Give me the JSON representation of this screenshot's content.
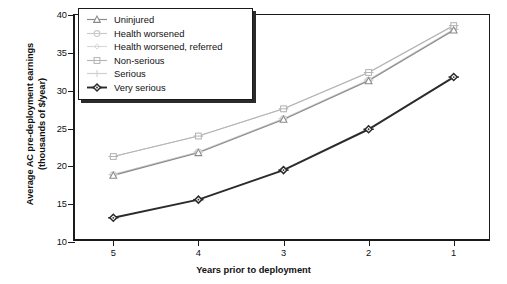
{
  "chart_data": {
    "type": "line",
    "title": "",
    "xlabel": "Years prior to deployment",
    "ylabel": "Average AC pre-deployment earnings (thousands of $/year)",
    "ylabel_line1": "Average AC pre-deployment earnings",
    "ylabel_line2": "(thousands of $/year)",
    "categories": [
      "5",
      "4",
      "3",
      "2",
      "1"
    ],
    "x": [
      5,
      4,
      3,
      2,
      1
    ],
    "xlim": [
      5.45,
      0.55
    ],
    "ylim": [
      10,
      40
    ],
    "yticks": [
      10,
      15,
      20,
      25,
      30,
      35,
      40
    ],
    "xticks": [
      5,
      4,
      3,
      2,
      1
    ],
    "grid": false,
    "legend_position": "top-left-inset",
    "series": [
      {
        "name": "Uninjured",
        "marker": "triangle",
        "color": "#8a8a8a",
        "values": [
          18.8,
          21.8,
          26.2,
          31.3,
          38.0
        ]
      },
      {
        "name": "Health worsened",
        "marker": "circle",
        "color": "#c9c9c9",
        "values": [
          18.9,
          21.9,
          26.3,
          31.4,
          38.1
        ]
      },
      {
        "name": "Health worsened, referred",
        "marker": "diamond-light",
        "color": "#d8d8d8",
        "values": [
          18.9,
          21.9,
          26.3,
          31.4,
          38.1
        ]
      },
      {
        "name": "Non-serious",
        "marker": "square",
        "color": "#b5b5b5",
        "values": [
          21.3,
          24.0,
          27.6,
          32.4,
          38.6
        ]
      },
      {
        "name": "Serious",
        "marker": "plus",
        "color": "#d0d0d0",
        "values": [
          21.3,
          24.0,
          27.6,
          32.4,
          38.6
        ]
      },
      {
        "name": "Very serious",
        "marker": "diamond-dark",
        "color": "#2b2b2b",
        "values": [
          13.2,
          15.6,
          19.5,
          24.9,
          31.8
        ]
      }
    ]
  },
  "legend": {
    "items": [
      {
        "label": "Uninjured"
      },
      {
        "label": "Health worsened"
      },
      {
        "label": "Health worsened, referred"
      },
      {
        "label": "Non-serious"
      },
      {
        "label": "Serious"
      },
      {
        "label": "Very serious"
      }
    ]
  },
  "axes": {
    "y_tick_labels": [
      "40",
      "35",
      "30",
      "25",
      "20",
      "15",
      "10"
    ],
    "x_tick_labels": [
      "5",
      "4",
      "3",
      "2",
      "1"
    ]
  }
}
